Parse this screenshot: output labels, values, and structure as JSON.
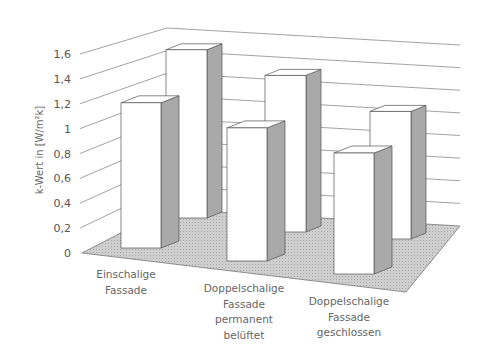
{
  "chart_data": {
    "type": "bar",
    "subtype": "3d-column",
    "title": "",
    "xlabel": "",
    "ylabel": "k-Wert in [W/m²k]",
    "ylim": [
      0,
      1.6
    ],
    "yticks": [
      "0",
      "0,2",
      "0,4",
      "0,6",
      "0,8",
      "1",
      "1,2",
      "1,4",
      "1,6"
    ],
    "grid": true,
    "legend": null,
    "categories": [
      [
        "Einschalige",
        "Fassade"
      ],
      [
        "Doppelschalige",
        "Fassade",
        "permanent",
        "belüftet"
      ],
      [
        "Doppelschalige",
        "Fassade",
        "geschlossen"
      ]
    ],
    "series": [
      {
        "name": "front row",
        "values": [
          1.2,
          1.1,
          1.0
        ]
      },
      {
        "name": "back row",
        "values": [
          1.45,
          1.35,
          1.1
        ]
      }
    ]
  },
  "colors": {
    "bar_front": "#ffffff",
    "bar_side": "#a9a9a9",
    "bar_top": "#ffffff",
    "floor": "#c4c4c4",
    "gridline": "#8a8a8a",
    "outline": "#555555"
  }
}
